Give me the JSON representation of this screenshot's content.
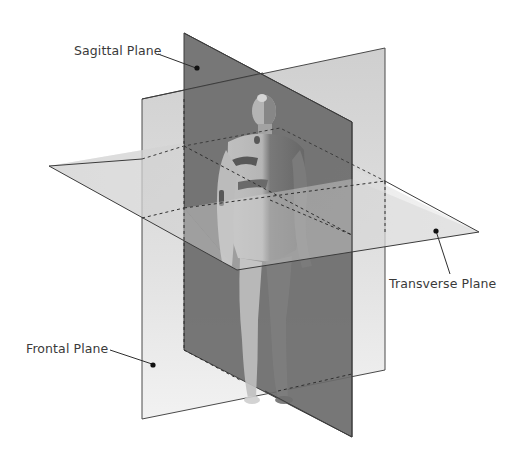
{
  "diagram": {
    "type": "anatomical-planes",
    "planes": [
      {
        "id": "sagittal",
        "label": "Sagittal Plane",
        "color": "#6e6e6e"
      },
      {
        "id": "frontal",
        "label": "Frontal Plane",
        "color": "#d9d9d9"
      },
      {
        "id": "transverse",
        "label": "Transverse Plane",
        "color": "#c4c4c4"
      }
    ]
  },
  "labels": {
    "sagittal": "Sagittal Plane",
    "transverse": "Transverse Plane",
    "frontal": "Frontal Plane"
  },
  "colors": {
    "background": "#ffffff",
    "sagittal_fill": "#6b6b6b",
    "frontal_fill": "#dcdcdc",
    "transverse_fill": "#bdbdbd",
    "edge": "#3c3c3c",
    "leader": "#2e2e2e",
    "text": "#3a3a3a"
  }
}
